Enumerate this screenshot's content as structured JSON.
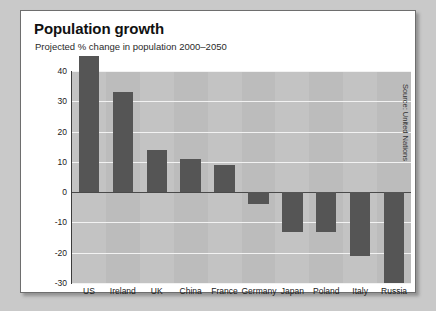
{
  "card": {
    "title": "Population growth",
    "subtitle": "Projected % change in population 2000–2050",
    "source": "Source: United Nations"
  },
  "chart_data": {
    "type": "bar",
    "title": "Population growth",
    "subtitle": "Projected % change in population 2000–2050",
    "xlabel": "",
    "ylabel": "",
    "ylim": [
      -30,
      40
    ],
    "yticks": [
      40,
      30,
      20,
      10,
      0,
      -10,
      -20,
      -30
    ],
    "grid": true,
    "legend": false,
    "note": "US bar exceeds the top of the plotting area (drawn overflowing above the 40 gridline)",
    "categories": [
      "US",
      "Ireland",
      "UK",
      "China",
      "France",
      "Germany",
      "Japan",
      "Poland",
      "Italy",
      "Russia"
    ],
    "values": [
      45,
      33,
      14,
      11,
      9,
      -4,
      -13,
      -13,
      -21,
      -30
    ],
    "bar_color": "#555555",
    "plot_background": "#c3c3c3",
    "band_color": "#bcbcbc",
    "gridline_color": "#f2f2f2"
  }
}
